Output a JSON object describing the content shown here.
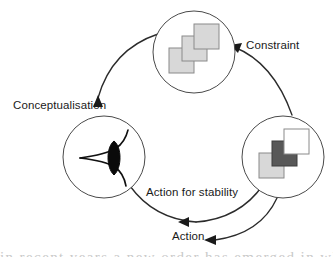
{
  "figure": {
    "background_color": "#ffffff",
    "width": 333,
    "height": 257
  },
  "labels": {
    "constraint": "Constraint",
    "conceptualisation": "Conceptualisation",
    "action_for_stability": "Action for stability",
    "action": "Action"
  },
  "nodes": [
    {
      "id": "top-node",
      "name": "constraint-node",
      "center_x": 194,
      "center_y": 52,
      "radius": 41,
      "content": "three-light-squares",
      "squares": [
        {
          "fill": "#d8d8d8",
          "border": "#8a8a8a"
        },
        {
          "fill": "#d8d8d8",
          "border": "#8a8a8a"
        },
        {
          "fill": "#d8d8d8",
          "border": "#8a8a8a"
        }
      ]
    },
    {
      "id": "right-node",
      "name": "action-node",
      "center_x": 283,
      "center_y": 157,
      "radius": 41,
      "content": "light-dark-white-squares",
      "squares": [
        {
          "fill": "#d8d8d8",
          "border": "#8a8a8a"
        },
        {
          "fill": "#585858",
          "border": "#3d3d3d"
        },
        {
          "fill": "#ffffff",
          "border": "#8a8a8a"
        }
      ]
    },
    {
      "id": "left-node",
      "name": "conceptualisation-node",
      "center_x": 104,
      "center_y": 157,
      "radius": 41,
      "content": "eye-symbol"
    }
  ],
  "arcs": [
    {
      "id": "arc-to-constraint",
      "name": "arc-right-to-top",
      "from": "right-node",
      "to": "top-node",
      "label": "Constraint",
      "arrowhead": "at-top-node"
    },
    {
      "id": "arc-to-conceptualisation",
      "name": "arc-top-to-left",
      "from": "top-node",
      "to": "left-node",
      "label": "Conceptualisation",
      "arrowhead": "at-left-node"
    },
    {
      "id": "arc-action-for-stability",
      "name": "arc-left-to-right-inner",
      "from": "left-node",
      "to": "right-node",
      "label": "Action for stability",
      "arrowhead": "mid-bottom-pointing-left"
    },
    {
      "id": "arc-action",
      "name": "arc-right-to-action-outer",
      "from": "right-node",
      "to": "action-label",
      "label": "Action",
      "arrowhead": "at-action-label"
    }
  ],
  "colors": {
    "stroke": "#2b2b2b",
    "circle_stroke": "#4a4a4a",
    "square_light": "#d8d8d8",
    "square_dark": "#585858",
    "square_white": "#ffffff",
    "square_border": "#8a8a8a",
    "text": "#1a1a1a"
  },
  "page_bleed": {
    "text": "in recent years a new order has emerged in which"
  }
}
